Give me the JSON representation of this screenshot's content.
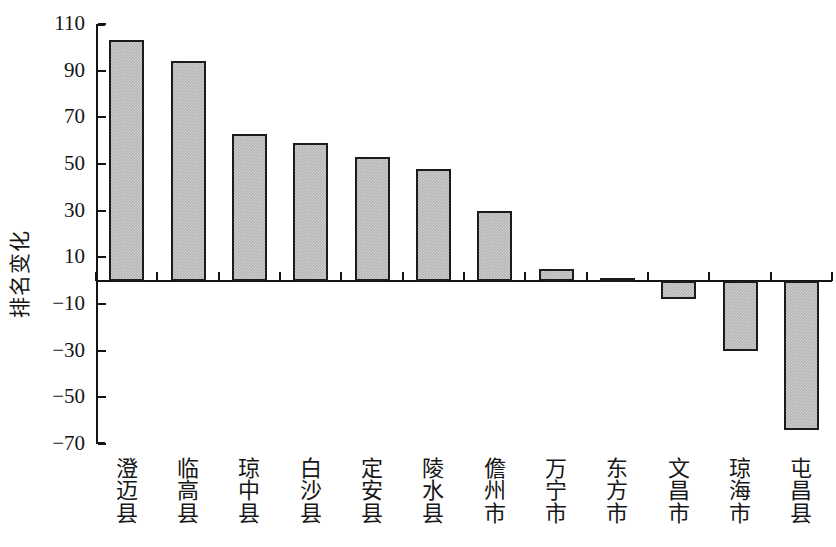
{
  "chart_data": {
    "type": "bar",
    "title": "",
    "xlabel": "",
    "ylabel": "排名变化",
    "ylim": [
      -70,
      110
    ],
    "ytick_step": 20,
    "grid": false,
    "legend": null,
    "categories": [
      "澄迈县",
      "临高县",
      "琼中县",
      "白沙县",
      "定安县",
      "陵水县",
      "儋州市",
      "万宁市",
      "东方市",
      "文昌市",
      "琼海市",
      "屯昌县"
    ],
    "values": [
      103,
      94,
      63,
      59,
      53,
      48,
      30,
      5,
      1,
      -8,
      -30,
      -64
    ],
    "ytick_labels": [
      "110",
      "90",
      "70",
      "50",
      "30",
      "10",
      "−10",
      "−30",
      "−50",
      "−70"
    ],
    "ytick_values": [
      110,
      90,
      70,
      50,
      30,
      10,
      -10,
      -30,
      -50,
      -70
    ],
    "bar_fill_color": "#b4b4b4",
    "bar_edge_color": "#1b1b1b",
    "axis_color": "#141414",
    "background_color": "#ffffff"
  }
}
